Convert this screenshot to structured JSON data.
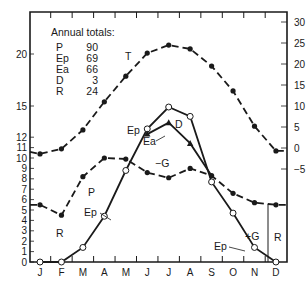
{
  "chart_data": {
    "type": "line",
    "title": "",
    "xlabel": "",
    "ylabel_left": "Water (P, Ep, Ea)",
    "ylabel_right": "Temperature (T)",
    "categories": [
      "J",
      "F",
      "M",
      "A",
      "M",
      "J",
      "J",
      "A",
      "S",
      "O",
      "N",
      "D"
    ],
    "left_axis": {
      "ticks": [
        0,
        1,
        2,
        3,
        4,
        5,
        6,
        7,
        8,
        9,
        10,
        11,
        12,
        15,
        20
      ],
      "ylim": [
        0,
        24
      ]
    },
    "right_axis": {
      "ticks": [
        -5,
        0,
        5,
        10,
        15,
        20,
        25,
        30
      ],
      "ylim": [
        -10,
        30
      ]
    },
    "series": [
      {
        "name": "T",
        "axis": "right",
        "style": "dashed",
        "marker": "filled-circle",
        "values": [
          -1.4,
          -0.2,
          4.3,
          11.0,
          17.1,
          22.6,
          24.5,
          23.6,
          19.5,
          13.6,
          5.2,
          -0.7
        ]
      },
      {
        "name": "P",
        "axis": "left",
        "style": "dash-dot",
        "marker": "filled-circle",
        "values": [
          5.5,
          4.5,
          8.2,
          10.0,
          9.9,
          8.6,
          8.1,
          9.0,
          8.3,
          6.6,
          5.7,
          5.5
        ]
      },
      {
        "name": "Ep",
        "axis": "left",
        "style": "solid",
        "marker": "open-circle",
        "values": [
          0,
          0,
          1.4,
          4.4,
          8.8,
          12.8,
          14.9,
          14.0,
          7.7,
          4.7,
          1.4,
          0
        ]
      },
      {
        "name": "Ea",
        "axis": "left",
        "style": "solid",
        "marker": "filled-triangle",
        "values": [
          null,
          null,
          null,
          null,
          null,
          12.3,
          13.4,
          11.4,
          8.3,
          null,
          null,
          null
        ]
      }
    ],
    "annotations": [
      {
        "text": "T",
        "x": 125,
        "y": 60
      },
      {
        "text": "P",
        "x": 88,
        "y": 196
      },
      {
        "text": "Ep",
        "x": 84,
        "y": 216
      },
      {
        "text": "R",
        "x": 56,
        "y": 237
      },
      {
        "text": "Ep",
        "x": 127,
        "y": 134
      },
      {
        "text": "D",
        "x": 175,
        "y": 128
      },
      {
        "text": "Ea",
        "x": 143,
        "y": 145
      },
      {
        "text": "−G",
        "x": 155,
        "y": 167
      },
      {
        "text": "+G",
        "x": 245,
        "y": 240
      },
      {
        "text": "Ep",
        "x": 214,
        "y": 250
      },
      {
        "text": "R",
        "x": 274,
        "y": 241
      }
    ],
    "annual_totals": {
      "P": 90,
      "Ep": 69,
      "Ea": 66,
      "D": 3,
      "R": 24
    },
    "grid": false,
    "legend": "none"
  },
  "totals": {
    "title": "Annual totals:",
    "rows": [
      {
        "k": "P",
        "v": "90"
      },
      {
        "k": "Ep",
        "v": "69"
      },
      {
        "k": "Ea",
        "v": "66"
      },
      {
        "k": "D",
        "v": "3"
      },
      {
        "k": "R",
        "v": "24"
      }
    ]
  },
  "colors": {
    "ink": "#1a1a1a",
    "background": "#ffffff"
  }
}
